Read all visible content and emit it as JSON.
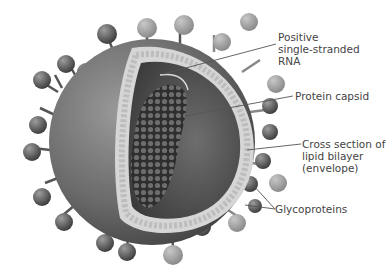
{
  "figure": {
    "labels": {
      "rna": "Positive\nsingle-stranded\nRNA",
      "capsid": "Protein capsid",
      "envelope": "Cross section of\nlipid bilayer\n(envelope)",
      "glycoproteins": "Glycoproteins"
    }
  },
  "colors": {
    "background": "#ffffff",
    "envelope_dark": "#4a4a4a",
    "envelope_mid": "#7a7a7a",
    "interior": "#5a5a5a",
    "capsid": "#3c3c3c",
    "bilayer": "#cfcfcf",
    "knob_dark": "#555555",
    "knob_light": "#9a9a9a",
    "leader_line": "#555555",
    "label_text": "#444444"
  }
}
